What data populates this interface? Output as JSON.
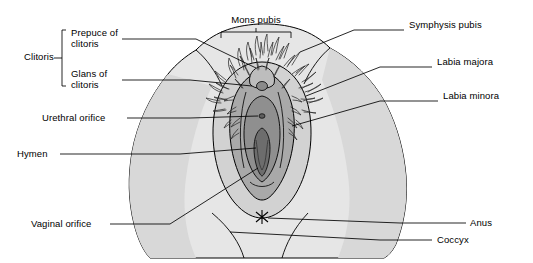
{
  "figure": {
    "colors": {
      "outline": "#000000",
      "skin_light": "#e4e4e4",
      "skin_mid": "#cfcfcf",
      "labia_minora": "#b3b3b3",
      "vestibule": "#9a9a9a",
      "inner_dark": "#8a8a8a",
      "hair": "#3a3a3a",
      "background": "#ffffff"
    },
    "labels": [
      {
        "id": "clitoris",
        "text": "Clitoris",
        "x": 24,
        "y": 57,
        "align": "left"
      },
      {
        "id": "prepuce",
        "text": "Prepuce of\nclitoris",
        "x": 72,
        "y": 33,
        "align": "left"
      },
      {
        "id": "glans",
        "text": "Glans of\nclitoris",
        "x": 72,
        "y": 73,
        "align": "left"
      },
      {
        "id": "urethral-orifice",
        "text": "Urethral orifice",
        "x": 43,
        "y": 114,
        "align": "left"
      },
      {
        "id": "hymen",
        "text": "Hymen",
        "x": 17,
        "y": 150,
        "align": "left"
      },
      {
        "id": "vaginal-orifice",
        "text": "Vaginal orifice",
        "x": 31,
        "y": 221,
        "align": "left"
      },
      {
        "id": "mons-pubis",
        "text": "Mons pubis",
        "x": 236,
        "y": 15,
        "align": "center"
      },
      {
        "id": "symphysis-pubis",
        "text": "Symphysis pubis",
        "x": 410,
        "y": 24,
        "align": "left"
      },
      {
        "id": "labia-majora",
        "text": "Labia majora",
        "x": 437,
        "y": 62,
        "align": "left"
      },
      {
        "id": "labia-minora",
        "text": "Labia minora",
        "x": 443,
        "y": 96,
        "align": "left"
      },
      {
        "id": "anus",
        "text": "Anus",
        "x": 470,
        "y": 219,
        "align": "left"
      },
      {
        "id": "coccyx",
        "text": "Coccyx",
        "x": 437,
        "y": 236,
        "align": "left"
      }
    ]
  }
}
